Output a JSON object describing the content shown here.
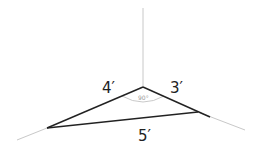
{
  "diagram": {
    "labels": {
      "side_left": "4′",
      "side_right": "3′",
      "hypotenuse": "5′",
      "angle": "90°"
    },
    "colors": {
      "axis": "#c8c8c8",
      "triangle": "#222222",
      "arc": "#bbbbbb"
    }
  }
}
